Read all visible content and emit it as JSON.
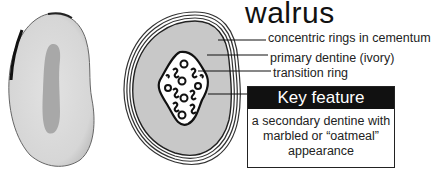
{
  "title": "walrus",
  "labels": {
    "cementum": "concentric rings in cementum",
    "primary_dentine": "primary dentine (ivory)",
    "transition_ring": "transition ring"
  },
  "key_feature": {
    "heading": "Key feature",
    "lines": [
      "a secondary dentine with",
      "marbled or “oatmeal”",
      "appearance"
    ]
  },
  "colors": {
    "dentine_fill": "#c8c8c8",
    "outline": "#222222",
    "key_header_bg": "#111111"
  }
}
